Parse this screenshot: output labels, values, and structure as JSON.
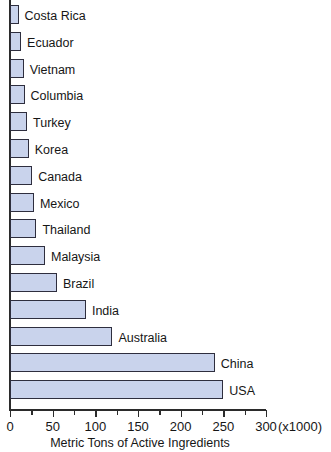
{
  "chart_data": {
    "type": "bar",
    "orientation": "horizontal",
    "title": "",
    "xlabel": "Metric Tons of Active Ingredients",
    "ylabel": "",
    "xlim": [
      0,
      300
    ],
    "xticks": [
      0,
      50,
      100,
      150,
      200,
      250,
      300
    ],
    "xtick_labels": [
      "0",
      "50",
      "100",
      "150",
      "200",
      "250",
      "300"
    ],
    "minor_tick_step": 25,
    "axis_multiplier": "(x1000)",
    "grid": false,
    "legend": null,
    "bar_fill_color": "#c9d3ec",
    "bar_edge_color": "#2e2e3e",
    "categories": [
      "Costa Rica",
      "Ecuador",
      "Vietnam",
      "Columbia",
      "Turkey",
      "Korea",
      "Canada",
      "Mexico",
      "Thailand",
      "Malaysia",
      "Brazil",
      "India",
      "Australia",
      "China",
      "USA"
    ],
    "values": [
      10,
      13,
      16,
      17,
      20,
      22,
      26,
      28,
      31,
      41,
      55,
      89,
      120,
      240,
      250
    ]
  }
}
